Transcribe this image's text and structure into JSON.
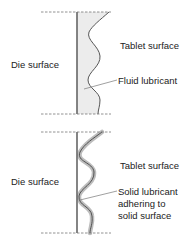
{
  "panels": [
    {
      "id": "fluid",
      "die_label": "Die surface",
      "tablet_label": "Tablet surface",
      "callout_label": "Fluid lubricant"
    },
    {
      "id": "solid",
      "die_label": "Die surface",
      "tablet_label": "Tablet surface",
      "callout_lines": [
        "Solid lubricant",
        "adhering to",
        "solid surface"
      ]
    }
  ],
  "colors": {
    "line": "#555555",
    "fill": "#ececec",
    "band": "#bdbdbd",
    "dash": "#777777"
  }
}
